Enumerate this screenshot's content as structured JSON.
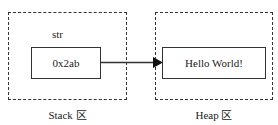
{
  "diagram": {
    "stack": {
      "region_label": "Stack 区",
      "variable_name": "str",
      "value": "0x2ab"
    },
    "heap": {
      "region_label": "Heap 区",
      "value": "Hello World!"
    },
    "arrow": {
      "from": "stack.value",
      "to": "heap.value"
    }
  }
}
